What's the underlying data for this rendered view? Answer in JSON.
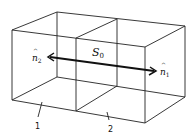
{
  "diagram": {
    "surface_label": "S",
    "surface_subscript": "0",
    "normals": [
      {
        "label": "n",
        "subscript": "1",
        "direction": "right"
      },
      {
        "label": "n",
        "subscript": "2",
        "direction": "left"
      }
    ],
    "regions": [
      {
        "label": "1"
      },
      {
        "label": "2"
      }
    ],
    "colors": {
      "line": "#222222",
      "background": "#ffffff"
    }
  }
}
